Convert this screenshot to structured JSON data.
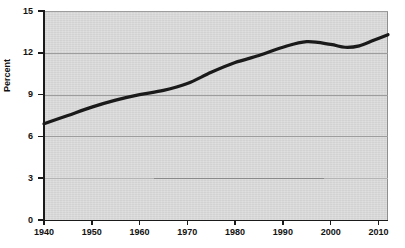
{
  "chart_data": {
    "type": "line",
    "title": "",
    "subtitle": "",
    "xlabel": "",
    "ylabel": "Percent",
    "xlim": [
      1940,
      2012
    ],
    "ylim": [
      0,
      15
    ],
    "grid": true,
    "legend": "none",
    "x_ticks": [
      1940,
      1950,
      1960,
      1970,
      1980,
      1990,
      2000,
      2010
    ],
    "x_tick_labels": [
      "1940",
      "1950",
      "1960",
      "1970",
      "1980",
      "1990",
      "2000",
      "2010"
    ],
    "y_ticks": [
      0,
      3,
      6,
      9,
      12,
      15
    ],
    "y_tick_labels": [
      "0",
      "3",
      "6",
      "9",
      "12",
      "15"
    ],
    "series": [
      {
        "name": "Percent",
        "color": "#1a1a1a",
        "line_width": 3.2,
        "x": [
          1940,
          1945,
          1950,
          1955,
          1960,
          1965,
          1970,
          1975,
          1980,
          1985,
          1990,
          1995,
          2000,
          2003,
          2006,
          2009,
          2012
        ],
        "values": [
          6.9,
          7.5,
          8.1,
          8.6,
          9.0,
          9.3,
          9.8,
          10.6,
          11.3,
          11.8,
          12.4,
          12.8,
          12.6,
          12.4,
          12.5,
          12.9,
          13.3
        ]
      }
    ]
  },
  "axes": {
    "y_title": "Percent"
  },
  "colors": {
    "plot_background": "#d8d8d8",
    "gridline": "#9d9d9d",
    "axis": "#1a1a1a",
    "series": "#1a1a1a",
    "page_background": "#ffffff"
  }
}
